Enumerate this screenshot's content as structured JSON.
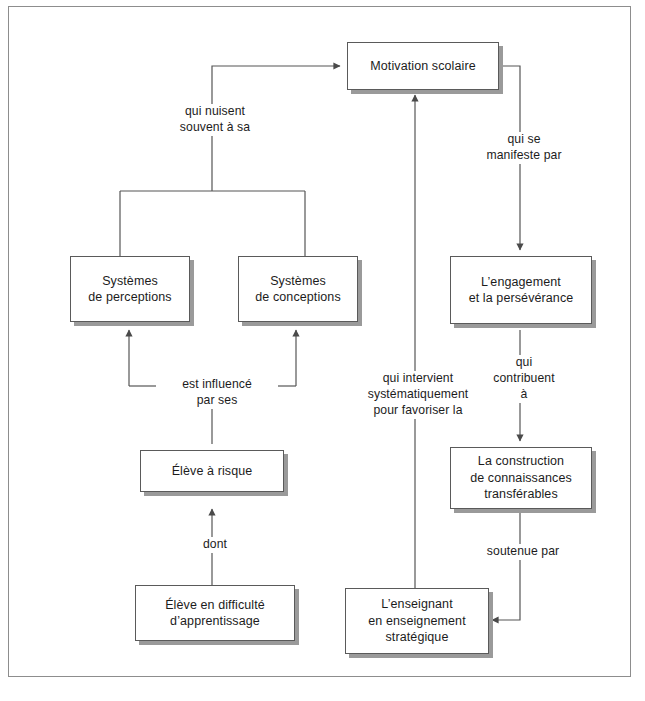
{
  "diagram": {
    "colors": {
      "frame_border": "#8d8d8d",
      "box_border": "#5a5a5a",
      "box_shadow": "#9a9a9a",
      "line": "#555555",
      "text": "#1c1c1c",
      "background": "#ffffff"
    },
    "nodes": [
      {
        "id": "motivation",
        "label": "Motivation scolaire"
      },
      {
        "id": "perceptions",
        "label": "Systèmes\nde perceptions"
      },
      {
        "id": "conceptions",
        "label": "Systèmes\nde conceptions"
      },
      {
        "id": "engagement",
        "label": "L’engagement\net la persévérance"
      },
      {
        "id": "construction",
        "label": "La construction\nde connaissances\ntransférables"
      },
      {
        "id": "eleve_risque",
        "label": "Élève à risque"
      },
      {
        "id": "eleve_diff",
        "label": "Élève en difficulté\nd’apprentissage"
      },
      {
        "id": "enseignant",
        "label": "L’enseignant\nen enseignement\nstratégique"
      }
    ],
    "edge_labels": [
      {
        "id": "qui_nuisent",
        "label": "qui nuisent\nsouvent à sa"
      },
      {
        "id": "qui_manifeste",
        "label": "qui se\nmanifeste par"
      },
      {
        "id": "est_influence",
        "label": "est influencé\npar ses"
      },
      {
        "id": "qui_intervient",
        "label": "qui intervient\nsystématiquement\npour favoriser la"
      },
      {
        "id": "qui_contribuent",
        "label": "qui\ncontribuent\nà"
      },
      {
        "id": "dont",
        "label": "dont"
      },
      {
        "id": "soutenue_par",
        "label": "soutenue par"
      }
    ]
  }
}
